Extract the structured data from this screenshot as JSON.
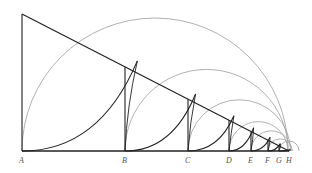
{
  "diagram": {
    "colors": {
      "line": "#222222",
      "arc": "#a8a8a8",
      "curve": "#222222",
      "label": "#555555"
    },
    "apex": [
      22,
      14
    ],
    "baseline_y": 151,
    "points": [
      {
        "label": "A",
        "x": 22
      },
      {
        "label": "B",
        "x": 125
      },
      {
        "label": "C",
        "x": 188
      },
      {
        "label": "D",
        "x": 229
      },
      {
        "label": "E",
        "x": 251
      },
      {
        "label": "F",
        "x": 268
      },
      {
        "label": "G",
        "x": 279
      },
      {
        "label": "H",
        "x": 289
      }
    ]
  }
}
